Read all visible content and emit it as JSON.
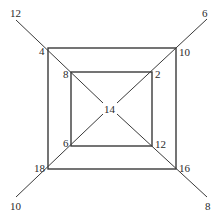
{
  "diagram": {
    "labels": {
      "outer_end_top_left": "12",
      "outer_end_top_right": "6",
      "outer_end_bottom_left": "10",
      "outer_end_bottom_right": "8",
      "outer_square_top_left": "4",
      "outer_square_top_right": "10",
      "outer_square_bottom_left": "18",
      "outer_square_bottom_right": "16",
      "inner_square_top_left": "8",
      "inner_square_top_right": "2",
      "inner_square_bottom_left": "6",
      "inner_square_bottom_right": "12",
      "center": "14"
    },
    "colors": {
      "line": "#3a3a3a",
      "text": "#2a2a2a",
      "background": "#ffffff"
    }
  }
}
